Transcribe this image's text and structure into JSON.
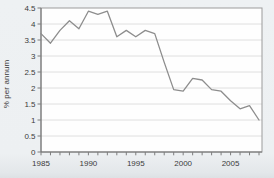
{
  "figure": {
    "background": "#edf0f2",
    "plot_background": "#fefefe"
  },
  "chart_data": {
    "type": "line",
    "title": "",
    "xlabel": "",
    "ylabel": "% per annum",
    "x": [
      1985,
      1986,
      1987,
      1988,
      1989,
      1990,
      1991,
      1992,
      1993,
      1994,
      1995,
      1996,
      1997,
      1998,
      1999,
      2000,
      2001,
      2002,
      2003,
      2004,
      2005,
      2006,
      2007,
      2008
    ],
    "values": [
      3.7,
      3.4,
      3.8,
      4.1,
      3.85,
      4.4,
      4.3,
      4.4,
      3.6,
      3.8,
      3.6,
      3.8,
      3.7,
      2.8,
      1.95,
      1.9,
      2.3,
      2.25,
      1.95,
      1.9,
      1.6,
      1.35,
      1.45,
      1.0
    ],
    "xlim": [
      1985,
      2008
    ],
    "ylim": [
      0,
      4.5
    ],
    "ytick_step": 0.5,
    "ytick_labels": [
      "0",
      "0.5",
      "1",
      "1.5",
      "2",
      "2.5",
      "3",
      "3.5",
      "4",
      "4.5"
    ],
    "xtick_minor_step": 1,
    "xtick_labeled_years": [
      1985,
      1990,
      1995,
      2000,
      2005
    ],
    "grid": "horizontal",
    "legend": "none",
    "colors": {
      "line": "#8d8d8d",
      "grid": "#d8d8d8",
      "frame": "#9b9b9b",
      "axis": "#707070",
      "text": "#3b3b3b"
    }
  }
}
